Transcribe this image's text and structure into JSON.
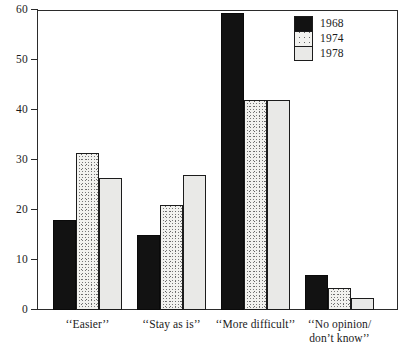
{
  "chart_data": {
    "type": "bar",
    "title": "",
    "subtitle": "",
    "xlabel": "",
    "ylabel": "",
    "ylim": [
      0,
      60
    ],
    "y_ticks": [
      0,
      10,
      20,
      30,
      40,
      50,
      60
    ],
    "grid": false,
    "legend_position": "top-right",
    "categories": [
      "‘‘Easier’’",
      "‘‘Stay as is’’",
      "‘‘More difficult’’",
      "‘‘No opinion/\ndon’t know’’"
    ],
    "series": [
      {
        "name": "1968",
        "color": "#121212",
        "pattern": "solid-black",
        "values": [
          18,
          15,
          59.5,
          7
        ]
      },
      {
        "name": "1974",
        "color": "#f2f2ef",
        "pattern": "stipple",
        "values": [
          31.5,
          21,
          42,
          4.5
        ]
      },
      {
        "name": "1978",
        "color": "#e9e9e7",
        "pattern": "light-gray",
        "values": [
          26.5,
          27,
          42,
          2.5
        ]
      }
    ]
  },
  "legend": {
    "items": [
      {
        "label": "1968"
      },
      {
        "label": "1974"
      },
      {
        "label": "1978"
      }
    ]
  },
  "axis": {
    "y_tick_labels": [
      "60",
      "50",
      "40",
      "30",
      "20",
      "10",
      "0"
    ]
  }
}
